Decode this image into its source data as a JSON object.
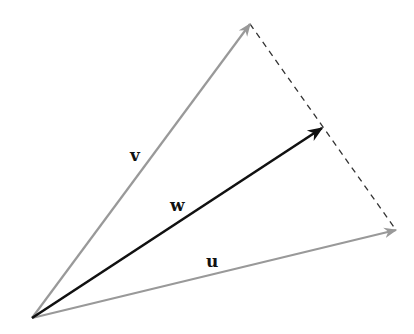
{
  "diagram": {
    "type": "vector-addition",
    "origin": {
      "x": 32,
      "y": 318
    },
    "vectors": [
      {
        "name": "v",
        "label": "v",
        "tip": {
          "x": 250,
          "y": 24
        },
        "color": "#999999",
        "width": 2.2,
        "label_pos": {
          "x": 137,
          "y": 160
        }
      },
      {
        "name": "w",
        "label": "w",
        "tip": {
          "x": 322,
          "y": 128
        },
        "color": "#111111",
        "width": 2.6,
        "label_pos": {
          "x": 178,
          "y": 210
        }
      },
      {
        "name": "u",
        "label": "u",
        "tip": {
          "x": 396,
          "y": 230
        },
        "color": "#999999",
        "width": 2.2,
        "label_pos": {
          "x": 213,
          "y": 267
        }
      }
    ],
    "dashed_line": {
      "from": {
        "x": 250,
        "y": 24
      },
      "to": {
        "x": 396,
        "y": 230
      },
      "color": "#333333"
    }
  }
}
